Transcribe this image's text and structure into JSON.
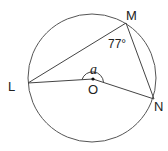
{
  "diagram": {
    "type": "circle-geometry",
    "circle": {
      "center_label": "O",
      "cx": 92,
      "cy": 78,
      "r": 64
    },
    "points": {
      "L": {
        "label": "L",
        "x": 28,
        "y": 83
      },
      "M": {
        "label": "M",
        "x": 126,
        "y": 23
      },
      "N": {
        "label": "N",
        "x": 154,
        "y": 99
      },
      "O": {
        "label": "O",
        "x": 93,
        "y": 79
      }
    },
    "segments": [
      "LM",
      "MN",
      "LO",
      "ON"
    ],
    "angles": {
      "LMN": {
        "label": "77°"
      },
      "LON": {
        "label": "a"
      }
    },
    "colors": {
      "stroke": "#444444",
      "text": "#222222"
    }
  }
}
